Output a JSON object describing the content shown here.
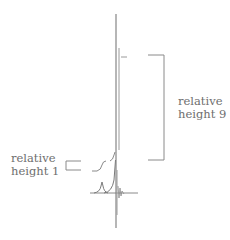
{
  "diagram": {
    "type": "nmr-spectrum-integration",
    "annotations": [
      {
        "id": "large",
        "line1": "relative",
        "line2": "height 9"
      },
      {
        "id": "small",
        "line1": "relative",
        "line2": "height 1"
      }
    ],
    "integration_ratio": {
      "small_peak": 1,
      "large_peak": 9
    },
    "colors": {
      "spectrum": "#7a7a7a",
      "bracket": "#8a8a8a",
      "text": "#6e6e6e"
    }
  }
}
